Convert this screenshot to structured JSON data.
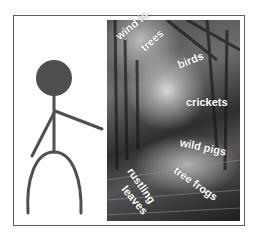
{
  "figure": {
    "head_color": "#4f4f4f",
    "stroke_color": "#4f4f4f"
  },
  "photo": {
    "subject": "forest path",
    "labels": [
      {
        "text": "wind in",
        "x": 117,
        "y": 38,
        "rotate": -38
      },
      {
        "text": "trees",
        "x": 142,
        "y": 50,
        "rotate": -42
      },
      {
        "text": "birds",
        "x": 178,
        "y": 66,
        "rotate": -22
      },
      {
        "text": "crickets",
        "x": 186,
        "y": 103,
        "rotate": 0
      },
      {
        "text": "wild pigs",
        "x": 180,
        "y": 143,
        "rotate": 12
      },
      {
        "text": "tree frogs",
        "x": 175,
        "y": 170,
        "rotate": 35
      },
      {
        "text": "rustling",
        "x": 130,
        "y": 170,
        "rotate": 55
      },
      {
        "text": "leaves",
        "x": 124,
        "y": 188,
        "rotate": 50
      }
    ]
  }
}
